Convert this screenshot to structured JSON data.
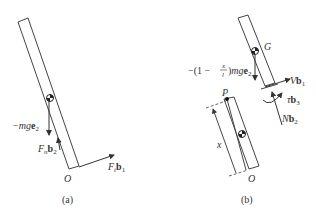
{
  "figure": {
    "panel_a": {
      "caption": "(a)",
      "labels": {
        "weight_force": {
          "prefix": "−",
          "var": "mg",
          "vec": "e",
          "sub": "2"
        },
        "normal_force": {
          "var": "F",
          "var_sub": "n",
          "vec": "b",
          "sub": "2"
        },
        "tangential_force": {
          "var": "F",
          "var_sub": "t",
          "vec": "b",
          "sub": "1"
        },
        "pivot": "O"
      }
    },
    "panel_b": {
      "caption": "(b)",
      "labels": {
        "weight_force": {
          "prefix": "−",
          "frac_pre": "1 − ",
          "frac_num": "x",
          "frac_den": "l",
          "var": "mg",
          "vec": "e",
          "sub": "2"
        },
        "center_of_mass": "G",
        "shear_force": {
          "var": "V",
          "vec": "b",
          "sub": "1"
        },
        "torque": {
          "var": "τ",
          "vec": "b",
          "sub": "3"
        },
        "axial_force": {
          "var": "N",
          "vec": "b",
          "sub": "2"
        },
        "cut_point": "P",
        "pivot": "O",
        "length_var": "x"
      }
    },
    "colors": {
      "line": "#444444",
      "text": "#333333",
      "background": "#ffffff"
    }
  }
}
